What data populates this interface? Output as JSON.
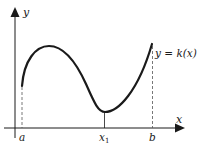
{
  "diagram": {
    "axes": {
      "x_label": "x",
      "y_label": "y"
    },
    "curve": {
      "label": "y = k(x)",
      "description": "smooth curve rising from a to a local maximum, descending to a local minimum at x1, rising to b"
    },
    "ticks": {
      "a": "a",
      "x1": "x",
      "x1_sub": "1",
      "b": "b"
    },
    "colors": {
      "ink": "#1a1a1a",
      "dashed": "#555555",
      "background": "#ffffff"
    }
  }
}
